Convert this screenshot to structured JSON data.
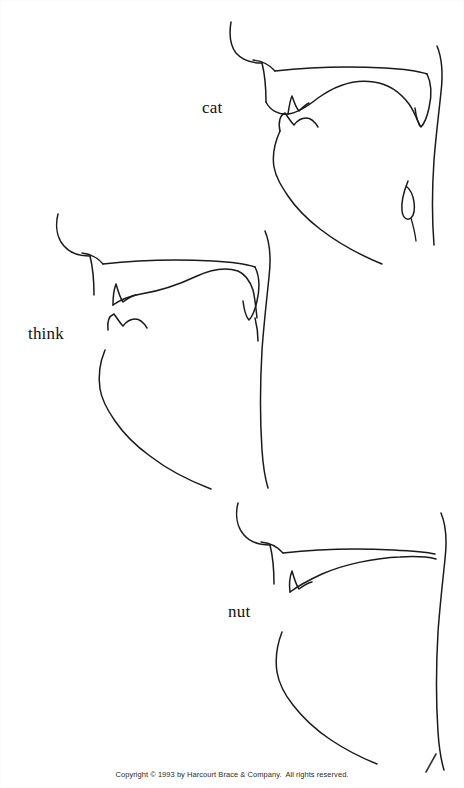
{
  "page": {
    "width": 464,
    "height": 788,
    "background_color": "#ffffff",
    "ink_color": "#1a1a1a",
    "type": "phonetics-articulation-figure"
  },
  "figure": {
    "title": "",
    "diagrams": [
      {
        "id": "cat",
        "label": "cat",
        "label_position": {
          "x": 202,
          "y": 98
        },
        "articulation": "velar",
        "place_of_articulation": "soft palate (velum)",
        "region": {
          "x": 225,
          "y": 20,
          "width": 239,
          "height": 255
        }
      },
      {
        "id": "think",
        "label": "think",
        "label_position": {
          "x": 28,
          "y": 324
        },
        "articulation": "interdental",
        "place_of_articulation": "between the teeth",
        "region": {
          "x": 40,
          "y": 205,
          "width": 240,
          "height": 285
        }
      },
      {
        "id": "nut",
        "label": "nut",
        "label_position": {
          "x": 228,
          "y": 602
        },
        "articulation": "alveolar",
        "place_of_articulation": "alveolar ridge",
        "region": {
          "x": 225,
          "y": 490,
          "width": 239,
          "height": 270
        }
      }
    ]
  },
  "footer": {
    "copyright": "Copyright © 1993 by Harcourt Brace & Company.  All rights reserved."
  }
}
